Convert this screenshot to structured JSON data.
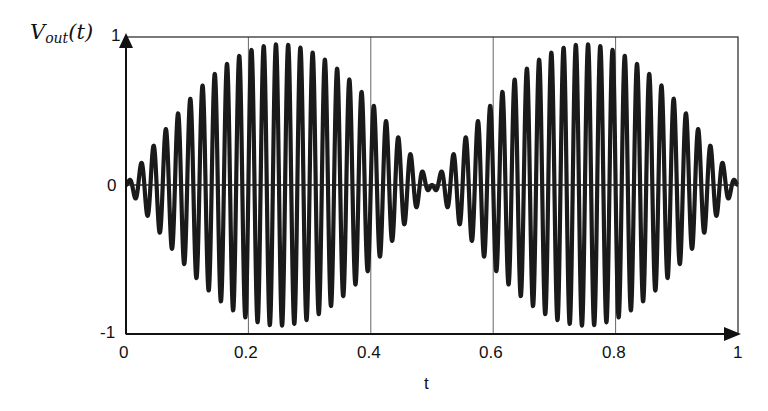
{
  "chart_data": {
    "type": "line",
    "title": "",
    "xlabel": "t",
    "ylabel": "V_out(t)",
    "ylabel_main": "V",
    "ylabel_sub": "out",
    "ylabel_arg": "(t)",
    "xlim": [
      0,
      1
    ],
    "ylim": [
      -1,
      1
    ],
    "x_ticks": [
      "0",
      "0.2",
      "0.4",
      "0.6",
      "0.8",
      "1"
    ],
    "y_ticks": [
      "-1",
      "0",
      "1"
    ],
    "grid": "vertical lines at x = 0.2, 0.4, 0.6, 0.8",
    "series": [
      {
        "name": "V_out(t)",
        "description": "Amplitude-modulated oscillation (beats): V_out(t) ≈ sin(2π·t)·sin(2π·50·t); envelope zeros at t = 0, 0.5, 1; peak amplitude ≈ 0.95",
        "envelope_frequency": 1,
        "carrier_cycles_per_unit_t": 50,
        "peak_amplitude": 0.95,
        "envelope_samples": {
          "t": [
            0,
            0.1,
            0.2,
            0.25,
            0.3,
            0.4,
            0.5,
            0.6,
            0.7,
            0.75,
            0.8,
            0.9,
            1.0
          ],
          "amplitude": [
            0.0,
            0.56,
            0.9,
            0.95,
            0.9,
            0.56,
            0.0,
            0.56,
            0.9,
            0.95,
            0.9,
            0.56,
            0.0
          ]
        }
      }
    ],
    "color": "#1a1a1a",
    "legend": "none"
  }
}
